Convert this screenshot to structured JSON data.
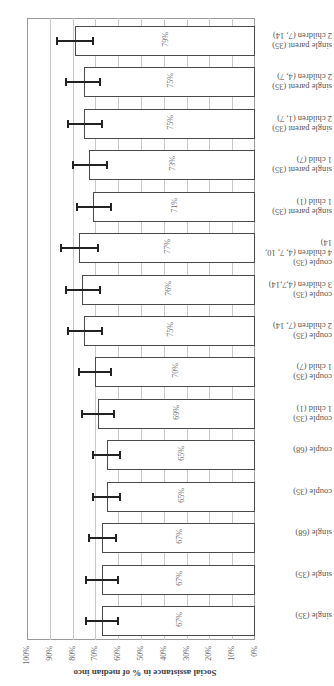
{
  "chart_data": {
    "type": "bar",
    "orientation": "horizontal, image rotated 180°",
    "title": "",
    "xlabel": "",
    "ylabel": "Social assistance in % of median inco",
    "ylim": [
      0,
      100
    ],
    "y_ticks": [
      "0%",
      "10%",
      "20%",
      "30%",
      "40%",
      "50%",
      "60%",
      "70%",
      "80%",
      "90%",
      "100%"
    ],
    "grid": true,
    "categories": [
      "single (35)",
      "single (68)",
      "couple (35)",
      "couple (68)",
      "couple (35)\n1 child (1)",
      "couple (35)\n1 child (7)",
      "couple (35)\n2 children (7, 14)",
      "couple (35)\n3 children (4,7,14)",
      "couple (35)\n4 children (4, 7, 10,\n14)",
      "single parent (35)\n1 child (1)",
      "single parent (35)\n1 child (7)",
      "single parent (35)\n2 children (1, 7)",
      "single parent (35)\n2 children (4, 7)",
      "single parent (35)\n2 children (7, 14)"
    ],
    "values": [
      67,
      67,
      65,
      65,
      69,
      70,
      75,
      76,
      77,
      71,
      73,
      75,
      75,
      79
    ],
    "value_labels": [
      "67%",
      "67%",
      "65%",
      "65%",
      "69%",
      "70%",
      "75%",
      "76%",
      "77%",
      "71%",
      "73%",
      "75%",
      "75%",
      "79%"
    ],
    "error_low": [
      60,
      61,
      59,
      59,
      62,
      63,
      67,
      68,
      69,
      63,
      65,
      67,
      68,
      71
    ],
    "error_high": [
      74,
      73,
      71,
      71,
      76,
      77,
      82,
      83,
      85,
      78,
      80,
      82,
      83,
      87
    ],
    "colors": {
      "bar_fill": "#ffffff",
      "bar_border": "#4a4a4a",
      "error_bar": "#222222",
      "grid": "#c9c9c9"
    }
  }
}
